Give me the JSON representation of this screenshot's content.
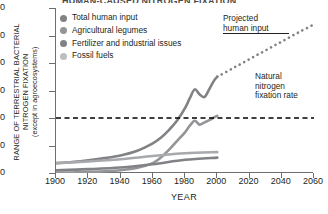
{
  "title": "HUMAN-CAUSED NITROGEN FIXATION",
  "y_axis": {
    "line1": "RANGE OF TERRESTRIAL BACTERIAL",
    "line2": "NITROGEN FIXATION",
    "line3": "(except in agroecosystems)",
    "ticks": [
      "0",
      "50",
      "100",
      "150",
      "200",
      "250",
      "300"
    ]
  },
  "x_axis": {
    "label": "YEAR",
    "ticks": [
      "1900",
      "1920",
      "1940",
      "1960",
      "1980",
      "2000",
      "2020",
      "2040",
      "2060"
    ]
  },
  "legend": [
    {
      "label": "Total human input",
      "color": "#808285",
      "icon": "legend-dot"
    },
    {
      "label": "Agricultural legumes",
      "color": "#939598",
      "icon": "legend-dot"
    },
    {
      "label": "Fertilizer and industrial issues",
      "color": "#808285",
      "icon": "legend-dot"
    },
    {
      "label": "Fossil fuels",
      "color": "#bcbec0",
      "icon": "legend-dot"
    }
  ],
  "annotations": {
    "projected_line1": "Projected",
    "projected_line2": "human input",
    "natural_line1": "Natural",
    "natural_line2": "nitrogen",
    "natural_line3": "fixation rate"
  },
  "chart_data": {
    "type": "line",
    "title": "HUMAN-CAUSED NITROGEN FIXATION",
    "xlabel": "YEAR",
    "ylabel": "RANGE OF TERRESTRIAL BACTERIAL NITROGEN FIXATION (except in agroecosystems)",
    "xlim": [
      1900,
      2060
    ],
    "ylim": [
      0,
      300
    ],
    "yticks": [
      0,
      50,
      100,
      150,
      200,
      250,
      300
    ],
    "xticks": [
      1900,
      1920,
      1940,
      1960,
      1980,
      2000,
      2020,
      2040,
      2060
    ],
    "grid": false,
    "legend_position": "upper-left",
    "reference_line": {
      "name": "Natural nitrogen fixation rate",
      "value": 100,
      "style": "dashed",
      "color": "#000000"
    },
    "series": [
      {
        "name": "Total human input",
        "color": "#808285",
        "style": "solid",
        "x": [
          1900,
          1910,
          1920,
          1930,
          1940,
          1950,
          1960,
          1965,
          1970,
          1975,
          1980,
          1983,
          1986,
          1989,
          1992,
          1995,
          1998,
          2000
        ],
        "values": [
          18,
          20,
          23,
          27,
          32,
          40,
          54,
          64,
          78,
          95,
          118,
          136,
          152,
          143,
          138,
          152,
          168,
          175
        ]
      },
      {
        "name": "Fertilizer and industrial issues",
        "color": "#939598",
        "style": "solid",
        "x": [
          1900,
          1910,
          1920,
          1930,
          1940,
          1950,
          1960,
          1965,
          1970,
          1975,
          1980,
          1983,
          1986,
          1989,
          1992,
          1995,
          1998,
          2000
        ],
        "values": [
          1,
          1,
          2,
          3,
          5,
          9,
          18,
          28,
          42,
          58,
          74,
          86,
          95,
          88,
          92,
          96,
          101,
          104
        ]
      },
      {
        "name": "Agricultural legumes",
        "color": "#a7a9ac",
        "style": "solid",
        "x": [
          1900,
          1920,
          1940,
          1960,
          1980,
          2000
        ],
        "values": [
          18,
          21,
          25,
          31,
          36,
          38
        ]
      },
      {
        "name": "Fossil fuels",
        "color": "#808285",
        "style": "solid",
        "x": [
          1900,
          1920,
          1940,
          1960,
          1980,
          2000
        ],
        "values": [
          5,
          7,
          10,
          16,
          24,
          28
        ]
      },
      {
        "name": "Projected human input",
        "color": "#808285",
        "style": "dotted",
        "x": [
          2000,
          2010,
          2020,
          2030,
          2040,
          2050,
          2060
        ],
        "values": [
          175,
          191,
          207,
          223,
          239,
          255,
          270
        ]
      }
    ]
  }
}
